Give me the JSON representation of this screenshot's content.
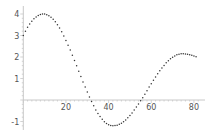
{
  "chart_data": {
    "type": "scatter",
    "title": "",
    "xlabel": "",
    "ylabel": "",
    "xlim": [
      0,
      82
    ],
    "ylim": [
      -1.3,
      4.2
    ],
    "grid": false,
    "legend": null,
    "x_ticks": [
      20,
      40,
      60,
      80
    ],
    "y_ticks": [
      -1,
      1,
      2,
      3,
      4
    ],
    "x_tick_labels": [
      "20",
      "40",
      "60",
      "80"
    ],
    "y_tick_labels": [
      "-1",
      "1",
      "2",
      "3",
      "4"
    ],
    "series": [
      {
        "name": "points",
        "color": "#333333",
        "x": [
          0,
          1,
          2,
          3,
          4,
          5,
          6,
          7,
          8,
          9,
          10,
          11,
          12,
          13,
          14,
          15,
          16,
          17,
          18,
          19,
          20,
          21,
          22,
          23,
          24,
          25,
          26,
          27,
          28,
          29,
          30,
          31,
          32,
          33,
          34,
          35,
          36,
          37,
          38,
          39,
          40,
          41,
          42,
          43,
          44,
          45,
          46,
          47,
          48,
          49,
          50,
          51,
          52,
          53,
          54,
          55,
          56,
          57,
          58,
          59,
          60,
          61,
          62,
          63,
          64,
          65,
          66,
          67,
          68,
          69,
          70,
          71,
          72,
          73,
          74,
          75,
          76,
          77,
          78,
          79,
          80,
          81
        ],
        "y": [
          3.0,
          3.2,
          3.38,
          3.53,
          3.66,
          3.78,
          3.86,
          3.93,
          3.98,
          4.0,
          4.0,
          3.97,
          3.92,
          3.85,
          3.76,
          3.64,
          3.5,
          3.35,
          3.17,
          2.98,
          2.77,
          2.55,
          2.32,
          2.08,
          1.84,
          1.59,
          1.34,
          1.09,
          0.84,
          0.6,
          0.37,
          0.14,
          -0.07,
          -0.27,
          -0.46,
          -0.63,
          -0.77,
          -0.9,
          -1.01,
          -1.09,
          -1.15,
          -1.19,
          -1.2,
          -1.19,
          -1.17,
          -1.13,
          -1.08,
          -1.01,
          -0.93,
          -0.83,
          -0.72,
          -0.6,
          -0.47,
          -0.33,
          -0.19,
          -0.04,
          0.11,
          0.27,
          0.43,
          0.6,
          0.76,
          0.92,
          1.07,
          1.22,
          1.36,
          1.49,
          1.61,
          1.73,
          1.83,
          1.92,
          1.99,
          2.05,
          2.1,
          2.13,
          2.15,
          2.15,
          2.14,
          2.13,
          2.11,
          2.08,
          2.05,
          2.01
        ]
      }
    ]
  },
  "layout": {
    "origin_px": [
      23.3,
      100
    ],
    "x_px_per_unit": 2.133,
    "y_px_per_unit": 21.5,
    "axis_color": "#c8c8c8",
    "x_axis_end_px": 205,
    "y_axis_top_px": 6,
    "y_axis_bottom_px": 130
  }
}
